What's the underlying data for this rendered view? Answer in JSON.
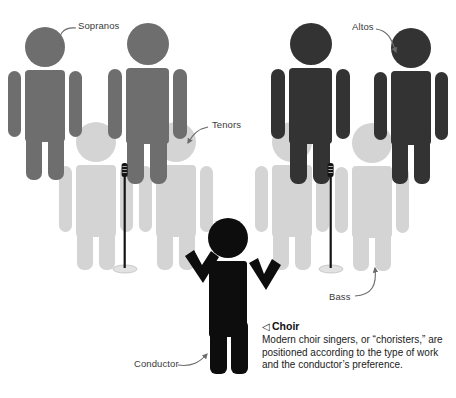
{
  "diagram": {
    "title": "Choir",
    "background_color": "#ffffff",
    "colors": {
      "sopranos": "#6e6e6e",
      "altos": "#333333",
      "tenors": "#d4d4d4",
      "bass": "#d4d4d4",
      "conductor": "#0d0d0d",
      "arrow": "#6b6b6b",
      "label_text": "#3a3a3a",
      "mic_stand": "#111111",
      "mic_base": "#e2e2e2"
    },
    "labels": [
      {
        "id": "sopranos",
        "text": "Sopranos",
        "x": 78,
        "y": 20
      },
      {
        "id": "tenors",
        "text": "Tenors",
        "x": 212,
        "y": 120
      },
      {
        "id": "altos",
        "text": "Altos",
        "x": 352,
        "y": 21
      },
      {
        "id": "bass",
        "text": "Bass",
        "x": 329,
        "y": 292
      },
      {
        "id": "conductor",
        "text": "Conductor",
        "x": 134,
        "y": 359
      }
    ],
    "caption": {
      "marker": "◁",
      "heading": "Choir",
      "body": "Modern choir singers, or “choristers,” are positioned according to the type of work and the conductor’s preference."
    },
    "figures": [
      {
        "id": "soprano-left",
        "part": "Sopranos",
        "color": "#6e6e6e",
        "x": 18,
        "y": 26,
        "scale": 1.0
      },
      {
        "id": "soprano-right",
        "part": "Sopranos",
        "color": "#6e6e6e",
        "x": 120,
        "y": 20,
        "scale": 1.06
      },
      {
        "id": "alto-left",
        "part": "Altos",
        "color": "#333333",
        "x": 283,
        "y": 20,
        "scale": 1.06
      },
      {
        "id": "alto-right",
        "part": "Altos",
        "color": "#333333",
        "x": 383,
        "y": 28,
        "scale": 1.0
      },
      {
        "id": "tenor-left",
        "part": "Tenors",
        "color": "#d4d4d4",
        "x": 62,
        "y": 118,
        "scale": 1.0
      },
      {
        "id": "tenor-right",
        "part": "Tenors",
        "color": "#d4d4d4",
        "x": 146,
        "y": 118,
        "scale": 1.0
      },
      {
        "id": "bass-left",
        "part": "Bass",
        "color": "#d4d4d4",
        "x": 272,
        "y": 118,
        "scale": 1.0
      },
      {
        "id": "bass-right",
        "part": "Bass",
        "color": "#d4d4d4",
        "x": 354,
        "y": 120,
        "scale": 1.0
      },
      {
        "id": "conductor",
        "part": "Conductor",
        "color": "#0d0d0d",
        "x": 190,
        "y": 222,
        "scale": 1.0
      }
    ],
    "microphones": [
      {
        "id": "microphone-left",
        "x": 124,
        "y": 165
      },
      {
        "id": "microphone-right",
        "x": 330,
        "y": 165
      }
    ]
  }
}
